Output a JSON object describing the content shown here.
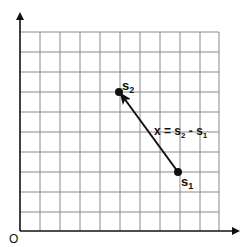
{
  "diagram": {
    "type": "vector-on-grid",
    "origin_label": "O",
    "grid": {
      "columns": 10,
      "rows": 10,
      "cell_px": 20,
      "left": 20,
      "top": 32,
      "line_color": "#8a8a8a"
    },
    "axes": {
      "color": "#111111",
      "x_arrow": true,
      "y_arrow": true
    },
    "points": [
      {
        "id": "s1",
        "label": "s",
        "subscript": "1",
        "grid_x": 8,
        "grid_y": 3
      },
      {
        "id": "s2",
        "label": "s",
        "subscript": "2",
        "grid_x": 5,
        "grid_y": 7
      }
    ],
    "vector": {
      "from": "s1",
      "to": "s2",
      "label_parts": [
        "x = s",
        "2",
        " - s",
        "1"
      ],
      "color": "#111111"
    }
  }
}
